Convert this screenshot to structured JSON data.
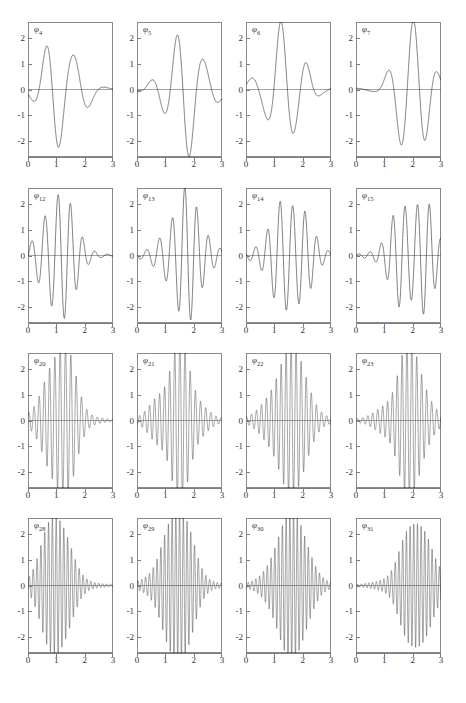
{
  "figure": {
    "rows": 4,
    "cols": 4,
    "axis": {
      "xticks": [
        "0",
        "1",
        "2",
        "3"
      ],
      "xtick_values": [
        0,
        1,
        2,
        3
      ],
      "yticks": [
        "2",
        "1",
        "0",
        "-1",
        "-2"
      ],
      "ytick_values": [
        2,
        1,
        0,
        -1,
        -2
      ],
      "xlim": [
        0,
        3
      ],
      "ylim": [
        -2.6,
        2.6
      ],
      "grid": false,
      "line_color": "#2b2b2b",
      "frame_color": "#8a8a8a"
    }
  },
  "chart_data": {
    "type": "line",
    "title": "",
    "xlabel": "",
    "ylabel": "",
    "xlim": [
      0,
      3
    ],
    "ylim": [
      -2.6,
      2.6
    ],
    "grid": false,
    "legend": "none",
    "panel_layout": [
      4,
      4
    ],
    "panels": [
      {
        "label": "φ",
        "index": "4",
        "row": 0,
        "col": 0,
        "center": 1.15,
        "frequency": 6.0,
        "envelope_width": 0.52,
        "peak_amplitude": 2.3,
        "tail_amplitude": 0.35,
        "seed": 4
      },
      {
        "label": "φ",
        "index": "5",
        "row": 0,
        "col": 1,
        "center": 1.75,
        "frequency": 6.4,
        "envelope_width": 0.55,
        "peak_amplitude": 2.3,
        "tail_amplitude": 0.45,
        "seed": 5
      },
      {
        "label": "φ",
        "index": "6",
        "row": 0,
        "col": 2,
        "center": 1.35,
        "frequency": 6.2,
        "envelope_width": 0.55,
        "peak_amplitude": 2.25,
        "tail_amplitude": 0.4,
        "seed": 6
      },
      {
        "label": "φ",
        "index": "7",
        "row": 0,
        "col": 3,
        "center": 2.0,
        "frequency": 6.6,
        "envelope_width": 0.5,
        "peak_amplitude": 2.4,
        "tail_amplitude": 0.35,
        "seed": 7
      },
      {
        "label": "φ",
        "index": "12",
        "row": 1,
        "col": 0,
        "center": 1.1,
        "frequency": 14.0,
        "envelope_width": 0.5,
        "peak_amplitude": 2.25,
        "tail_amplitude": 0.35,
        "seed": 12
      },
      {
        "label": "φ",
        "index": "13",
        "row": 1,
        "col": 1,
        "center": 1.65,
        "frequency": 14.5,
        "envelope_width": 0.55,
        "peak_amplitude": 2.3,
        "tail_amplitude": 0.4,
        "seed": 13
      },
      {
        "label": "φ",
        "index": "14",
        "row": 1,
        "col": 2,
        "center": 1.55,
        "frequency": 14.8,
        "envelope_width": 0.55,
        "peak_amplitude": 2.3,
        "tail_amplitude": 0.4,
        "seed": 14
      },
      {
        "label": "φ",
        "index": "15",
        "row": 1,
        "col": 3,
        "center": 2.0,
        "frequency": 15.2,
        "envelope_width": 0.55,
        "peak_amplitude": 2.35,
        "tail_amplitude": 0.4,
        "seed": 15
      },
      {
        "label": "φ",
        "index": "20",
        "row": 2,
        "col": 0,
        "center": 1.1,
        "frequency": 34.0,
        "envelope_width": 0.48,
        "peak_amplitude": 2.5,
        "tail_amplitude": 0.45,
        "seed": 20
      },
      {
        "label": "φ",
        "index": "21",
        "row": 2,
        "col": 1,
        "center": 1.45,
        "frequency": 35.0,
        "envelope_width": 0.5,
        "peak_amplitude": 2.5,
        "tail_amplitude": 0.45,
        "seed": 21
      },
      {
        "label": "φ",
        "index": "22",
        "row": 2,
        "col": 2,
        "center": 1.5,
        "frequency": 35.5,
        "envelope_width": 0.52,
        "peak_amplitude": 2.5,
        "tail_amplitude": 0.45,
        "seed": 22
      },
      {
        "label": "φ",
        "index": "23",
        "row": 2,
        "col": 3,
        "center": 1.85,
        "frequency": 36.0,
        "envelope_width": 0.52,
        "peak_amplitude": 2.45,
        "tail_amplitude": 0.45,
        "seed": 23
      },
      {
        "label": "φ",
        "index": "28",
        "row": 3,
        "col": 0,
        "center": 1.05,
        "frequency": 46.0,
        "envelope_width": 0.45,
        "peak_amplitude": 2.5,
        "tail_amplitude": 0.5,
        "seed": 28
      },
      {
        "label": "φ",
        "index": "29",
        "row": 3,
        "col": 1,
        "center": 1.4,
        "frequency": 47.0,
        "envelope_width": 0.48,
        "peak_amplitude": 2.5,
        "tail_amplitude": 0.5,
        "seed": 29
      },
      {
        "label": "φ",
        "index": "30",
        "row": 3,
        "col": 2,
        "center": 1.55,
        "frequency": 47.5,
        "envelope_width": 0.5,
        "peak_amplitude": 2.5,
        "tail_amplitude": 0.5,
        "seed": 30
      },
      {
        "label": "φ",
        "index": "31",
        "row": 3,
        "col": 3,
        "center": 2.15,
        "frequency": 48.0,
        "envelope_width": 0.5,
        "peak_amplitude": 2.45,
        "tail_amplitude": 0.5,
        "seed": 31
      }
    ]
  }
}
